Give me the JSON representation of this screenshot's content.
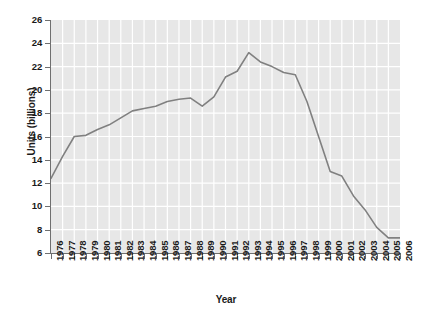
{
  "chart_data": {
    "type": "line",
    "title": "",
    "xlabel": "Year",
    "ylabel": "Units (billions)",
    "xlim": [
      1976,
      2006
    ],
    "ylim": [
      6,
      26
    ],
    "ytick_step": 2,
    "grid": true,
    "legend": null,
    "legend_position": "none",
    "line_color": "#808080",
    "plot_background": "#e7e7e7",
    "gridline_color": "#ffffff",
    "axis_color": "#6f6f6f",
    "categories": [
      "1976",
      "1977",
      "1978",
      "1979",
      "1980",
      "1981",
      "1982",
      "1983",
      "1984",
      "1985",
      "1986",
      "1987",
      "1988",
      "1989",
      "1990",
      "1991",
      "1992",
      "1993",
      "1994",
      "1995",
      "1996",
      "1997",
      "1998",
      "1999",
      "2000",
      "2001",
      "2002",
      "2003",
      "2004",
      "2005",
      "2006"
    ],
    "yticks": [
      "6",
      "8",
      "10",
      "12",
      "14",
      "16",
      "18",
      "20",
      "22",
      "24",
      "26"
    ],
    "values": [
      12.4,
      14.3,
      16.0,
      16.1,
      16.6,
      17.0,
      17.6,
      18.2,
      18.4,
      18.6,
      19.0,
      19.2,
      19.3,
      18.6,
      19.4,
      21.1,
      21.6,
      23.2,
      22.4,
      22.0,
      21.5,
      21.3,
      19.0,
      16.0,
      13.0,
      12.6,
      10.9,
      9.7,
      8.2,
      7.3,
      7.3
    ]
  }
}
